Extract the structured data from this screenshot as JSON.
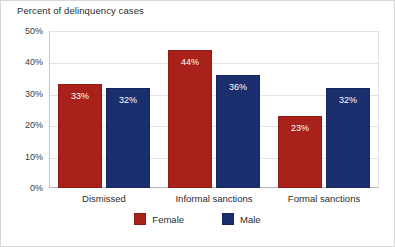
{
  "chart_data": {
    "type": "bar",
    "title": "Percent of delinquency cases",
    "xlabel": "",
    "ylabel": "",
    "categories": [
      "Dismissed",
      "Informal sanctions",
      "Formal sanctions"
    ],
    "series": [
      {
        "name": "Female",
        "color": "#a8211a",
        "values": [
          33,
          44,
          23
        ],
        "labels": [
          "33%",
          "44%",
          "23%"
        ]
      },
      {
        "name": "Male",
        "color": "#1b2e6e",
        "values": [
          32,
          36,
          32
        ],
        "labels": [
          "32%",
          "36%",
          "32%"
        ]
      }
    ],
    "ylim": [
      0,
      50
    ],
    "ytick_values": [
      0,
      10,
      20,
      30,
      40,
      50
    ],
    "ytick_labels": [
      "0%",
      "10%",
      "20%",
      "30%",
      "40%",
      "50%"
    ],
    "grid": true,
    "legend_position": "bottom-center",
    "value_label_format": "percent"
  }
}
